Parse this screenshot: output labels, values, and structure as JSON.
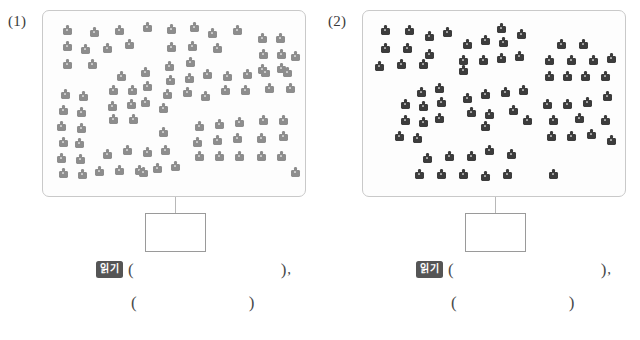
{
  "page": {
    "width": 640,
    "height": 340,
    "background": "#ffffff"
  },
  "colors": {
    "panel_border": "#c9c9c9",
    "box_border": "#9a9a9a",
    "connector": "#b8b8b8",
    "badge_background": "#555555",
    "badge_text": "#ffffff",
    "icon_light": "#8d8d8d",
    "icon_dark": "#3c3c3c",
    "text": "#4a4a4a"
  },
  "groups": [
    {
      "id": "group-1",
      "index_label": "(1)",
      "panel": {
        "name": "figure-panel-1",
        "shade": "light",
        "icon_color": "#8d8d8d",
        "icon_count": 92,
        "icons": [
          {
            "x": 20,
            "y": 14
          },
          {
            "x": 47,
            "y": 16
          },
          {
            "x": 72,
            "y": 14
          },
          {
            "x": 100,
            "y": 11
          },
          {
            "x": 20,
            "y": 30
          },
          {
            "x": 38,
            "y": 33
          },
          {
            "x": 60,
            "y": 32
          },
          {
            "x": 82,
            "y": 28
          },
          {
            "x": 20,
            "y": 48
          },
          {
            "x": 45,
            "y": 48
          },
          {
            "x": 124,
            "y": 13
          },
          {
            "x": 147,
            "y": 11
          },
          {
            "x": 165,
            "y": 17
          },
          {
            "x": 190,
            "y": 14
          },
          {
            "x": 124,
            "y": 31
          },
          {
            "x": 145,
            "y": 30
          },
          {
            "x": 170,
            "y": 32
          },
          {
            "x": 122,
            "y": 50
          },
          {
            "x": 143,
            "y": 46
          },
          {
            "x": 215,
            "y": 22
          },
          {
            "x": 233,
            "y": 22
          },
          {
            "x": 216,
            "y": 38
          },
          {
            "x": 234,
            "y": 38
          },
          {
            "x": 215,
            "y": 53
          },
          {
            "x": 234,
            "y": 52
          },
          {
            "x": 248,
            "y": 40
          },
          {
            "x": 74,
            "y": 60
          },
          {
            "x": 98,
            "y": 56
          },
          {
            "x": 66,
            "y": 74
          },
          {
            "x": 85,
            "y": 74
          },
          {
            "x": 100,
            "y": 70
          },
          {
            "x": 65,
            "y": 90
          },
          {
            "x": 84,
            "y": 88
          },
          {
            "x": 98,
            "y": 86
          },
          {
            "x": 66,
            "y": 103
          },
          {
            "x": 86,
            "y": 103
          },
          {
            "x": 18,
            "y": 78
          },
          {
            "x": 36,
            "y": 80
          },
          {
            "x": 16,
            "y": 94
          },
          {
            "x": 34,
            "y": 96
          },
          {
            "x": 14,
            "y": 110
          },
          {
            "x": 34,
            "y": 112
          },
          {
            "x": 16,
            "y": 126
          },
          {
            "x": 32,
            "y": 127
          },
          {
            "x": 14,
            "y": 142
          },
          {
            "x": 33,
            "y": 143
          },
          {
            "x": 16,
            "y": 157
          },
          {
            "x": 35,
            "y": 158
          },
          {
            "x": 123,
            "y": 64
          },
          {
            "x": 142,
            "y": 62
          },
          {
            "x": 160,
            "y": 58
          },
          {
            "x": 120,
            "y": 78
          },
          {
            "x": 140,
            "y": 76
          },
          {
            "x": 158,
            "y": 80
          },
          {
            "x": 116,
            "y": 92
          },
          {
            "x": 180,
            "y": 60
          },
          {
            "x": 200,
            "y": 58
          },
          {
            "x": 218,
            "y": 56
          },
          {
            "x": 178,
            "y": 74
          },
          {
            "x": 198,
            "y": 74
          },
          {
            "x": 222,
            "y": 72
          },
          {
            "x": 240,
            "y": 56
          },
          {
            "x": 243,
            "y": 72
          },
          {
            "x": 152,
            "y": 110
          },
          {
            "x": 172,
            "y": 108
          },
          {
            "x": 192,
            "y": 106
          },
          {
            "x": 150,
            "y": 126
          },
          {
            "x": 170,
            "y": 124
          },
          {
            "x": 190,
            "y": 122
          },
          {
            "x": 152,
            "y": 140
          },
          {
            "x": 172,
            "y": 140
          },
          {
            "x": 192,
            "y": 140
          },
          {
            "x": 216,
            "y": 104
          },
          {
            "x": 236,
            "y": 104
          },
          {
            "x": 214,
            "y": 122
          },
          {
            "x": 236,
            "y": 120
          },
          {
            "x": 214,
            "y": 140
          },
          {
            "x": 234,
            "y": 140
          },
          {
            "x": 60,
            "y": 138
          },
          {
            "x": 80,
            "y": 134
          },
          {
            "x": 100,
            "y": 136
          },
          {
            "x": 118,
            "y": 134
          },
          {
            "x": 52,
            "y": 155
          },
          {
            "x": 72,
            "y": 154
          },
          {
            "x": 92,
            "y": 154
          },
          {
            "x": 110,
            "y": 152
          },
          {
            "x": 128,
            "y": 150
          },
          {
            "x": 116,
            "y": 116
          },
          {
            "x": 96,
            "y": 156
          },
          {
            "x": 248,
            "y": 156
          }
        ]
      },
      "connector": {
        "name": "panel-to-box-connector-1"
      },
      "answer_box": {
        "name": "answer-box-1",
        "value": ""
      },
      "answer_rows": [
        {
          "badge": "읽기",
          "open_paren": "(",
          "blank": "",
          "close_paren": ")",
          "trailing": ","
        },
        {
          "badge": "",
          "open_paren": "(",
          "blank": "",
          "close_paren": ")",
          "trailing": ""
        }
      ]
    },
    {
      "id": "group-2",
      "index_label": "(2)",
      "panel": {
        "name": "figure-panel-2",
        "shade": "dark",
        "icon_color": "#3c3c3c",
        "icon_count": 66,
        "icons": [
          {
            "x": 18,
            "y": 14
          },
          {
            "x": 42,
            "y": 14
          },
          {
            "x": 62,
            "y": 20
          },
          {
            "x": 80,
            "y": 16
          },
          {
            "x": 18,
            "y": 32
          },
          {
            "x": 40,
            "y": 32
          },
          {
            "x": 62,
            "y": 38
          },
          {
            "x": 12,
            "y": 50
          },
          {
            "x": 34,
            "y": 48
          },
          {
            "x": 56,
            "y": 48
          },
          {
            "x": 100,
            "y": 28
          },
          {
            "x": 118,
            "y": 24
          },
          {
            "x": 136,
            "y": 26
          },
          {
            "x": 154,
            "y": 18
          },
          {
            "x": 96,
            "y": 44
          },
          {
            "x": 116,
            "y": 44
          },
          {
            "x": 134,
            "y": 42
          },
          {
            "x": 152,
            "y": 40
          },
          {
            "x": 96,
            "y": 54
          },
          {
            "x": 134,
            "y": 12
          },
          {
            "x": 194,
            "y": 28
          },
          {
            "x": 216,
            "y": 28
          },
          {
            "x": 182,
            "y": 44
          },
          {
            "x": 204,
            "y": 44
          },
          {
            "x": 226,
            "y": 44
          },
          {
            "x": 244,
            "y": 42
          },
          {
            "x": 182,
            "y": 60
          },
          {
            "x": 200,
            "y": 60
          },
          {
            "x": 218,
            "y": 60
          },
          {
            "x": 238,
            "y": 60
          },
          {
            "x": 54,
            "y": 76
          },
          {
            "x": 72,
            "y": 72
          },
          {
            "x": 38,
            "y": 88
          },
          {
            "x": 56,
            "y": 90
          },
          {
            "x": 74,
            "y": 86
          },
          {
            "x": 38,
            "y": 104
          },
          {
            "x": 56,
            "y": 106
          },
          {
            "x": 72,
            "y": 102
          },
          {
            "x": 32,
            "y": 120
          },
          {
            "x": 50,
            "y": 122
          },
          {
            "x": 100,
            "y": 82
          },
          {
            "x": 118,
            "y": 78
          },
          {
            "x": 138,
            "y": 76
          },
          {
            "x": 156,
            "y": 74
          },
          {
            "x": 104,
            "y": 96
          },
          {
            "x": 122,
            "y": 98
          },
          {
            "x": 146,
            "y": 94
          },
          {
            "x": 118,
            "y": 110
          },
          {
            "x": 160,
            "y": 104
          },
          {
            "x": 180,
            "y": 88
          },
          {
            "x": 200,
            "y": 88
          },
          {
            "x": 220,
            "y": 86
          },
          {
            "x": 240,
            "y": 80
          },
          {
            "x": 186,
            "y": 104
          },
          {
            "x": 212,
            "y": 102
          },
          {
            "x": 238,
            "y": 104
          },
          {
            "x": 184,
            "y": 120
          },
          {
            "x": 204,
            "y": 120
          },
          {
            "x": 224,
            "y": 118
          },
          {
            "x": 244,
            "y": 124
          },
          {
            "x": 60,
            "y": 142
          },
          {
            "x": 82,
            "y": 140
          },
          {
            "x": 104,
            "y": 140
          },
          {
            "x": 122,
            "y": 134
          },
          {
            "x": 144,
            "y": 138
          },
          {
            "x": 52,
            "y": 158
          },
          {
            "x": 74,
            "y": 158
          },
          {
            "x": 96,
            "y": 158
          },
          {
            "x": 118,
            "y": 160
          },
          {
            "x": 140,
            "y": 158
          },
          {
            "x": 186,
            "y": 158
          }
        ]
      },
      "connector": {
        "name": "panel-to-box-connector-2"
      },
      "answer_box": {
        "name": "answer-box-2",
        "value": ""
      },
      "answer_rows": [
        {
          "badge": "읽기",
          "open_paren": "(",
          "blank": "",
          "close_paren": ")",
          "trailing": ","
        },
        {
          "badge": "",
          "open_paren": "(",
          "blank": "",
          "close_paren": ")",
          "trailing": ""
        }
      ]
    }
  ]
}
